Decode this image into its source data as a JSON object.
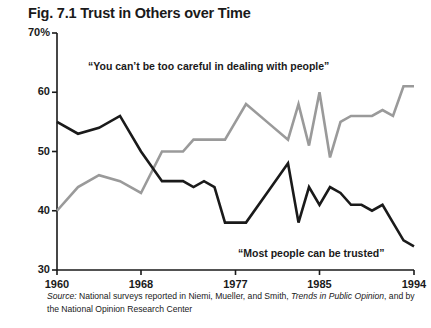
{
  "figure": {
    "title": "Fig. 7.1 Trust in Others over Time"
  },
  "source": {
    "label": "Source:",
    "text_before": " National surveys reported in Niemi, Mueller, and Smith, ",
    "work": "Trends in Public Opinion",
    "text_after": ", and by the National Opinion Research Center"
  },
  "annotations": {
    "careful": "“You can’t be too careful in dealing with people”",
    "trusted": "“Most people can be trusted”"
  },
  "colors": {
    "careful_line": "#9a9a9a",
    "trusted_line": "#1a1a1a",
    "axis": "#1a1a1a",
    "background": "#ffffff"
  },
  "chart_data": {
    "type": "line",
    "title": "Fig. 7.1 Trust in Others over Time",
    "xlabel": "",
    "ylabel": "",
    "xlim": [
      1960,
      1994
    ],
    "ylim": [
      30,
      70
    ],
    "yticks": [
      30,
      40,
      50,
      60,
      70
    ],
    "ytick_labels": [
      "30",
      "40",
      "50",
      "60",
      "70%"
    ],
    "xticks": [
      1960,
      1968,
      1977,
      1985,
      1994
    ],
    "xtick_labels": [
      "1960",
      "1968",
      "1977",
      "1985",
      "1994"
    ],
    "grid": false,
    "legend": "inline-annotations",
    "series": [
      {
        "name": "“You can’t be too careful in dealing with people”",
        "color": "#9a9a9a",
        "x": [
          1960,
          1962,
          1964,
          1966,
          1968,
          1970,
          1972,
          1973,
          1974,
          1975,
          1976,
          1977,
          1978,
          1980,
          1982,
          1983,
          1984,
          1985,
          1986,
          1987,
          1988,
          1989,
          1990,
          1991,
          1992,
          1993,
          1994
        ],
        "values": [
          40,
          44,
          46,
          45,
          43,
          50,
          50,
          52,
          52,
          52,
          52,
          55,
          58,
          55,
          52,
          58,
          51,
          60,
          49,
          55,
          56,
          56,
          56,
          57,
          56,
          61,
          61
        ]
      },
      {
        "name": "“Most people can be trusted”",
        "color": "#1a1a1a",
        "x": [
          1960,
          1962,
          1964,
          1966,
          1968,
          1970,
          1972,
          1973,
          1974,
          1975,
          1976,
          1977,
          1978,
          1980,
          1982,
          1983,
          1984,
          1985,
          1986,
          1987,
          1988,
          1989,
          1990,
          1991,
          1992,
          1993,
          1994
        ],
        "values": [
          55,
          53,
          54,
          56,
          50,
          45,
          45,
          44,
          45,
          44,
          38,
          38,
          38,
          43,
          48,
          38,
          44,
          41,
          44,
          43,
          41,
          41,
          40,
          41,
          38,
          35,
          34
        ]
      }
    ]
  }
}
